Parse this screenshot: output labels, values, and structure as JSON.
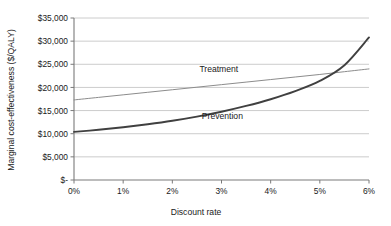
{
  "chart_data": {
    "type": "line",
    "title": "",
    "xlabel": "Discount rate",
    "ylabel": "Marginal cost-effectiveness ($/QALY)",
    "xlim": [
      0,
      6
    ],
    "ylim": [
      0,
      35000
    ],
    "grid": true,
    "grid_axis": "y",
    "legend": "inline-labels",
    "xticks": [
      0,
      1,
      2,
      3,
      4,
      5,
      6
    ],
    "xticklabels": [
      "0%",
      "1%",
      "2%",
      "3%",
      "4%",
      "5%",
      "6%"
    ],
    "yticks": [
      0,
      5000,
      10000,
      15000,
      20000,
      25000,
      30000,
      35000
    ],
    "yticklabels": [
      "$-",
      "$5,000",
      "$10,000",
      "$15,000",
      "$20,000",
      "$25,000",
      "$30,000",
      "$35,000"
    ],
    "x": [
      0,
      0.5,
      1,
      1.5,
      2,
      2.5,
      3,
      3.5,
      4,
      4.5,
      5,
      5.5,
      6
    ],
    "series": [
      {
        "name": "Treatment",
        "color": "#8c8c8c",
        "width": 1.0,
        "values": [
          17300,
          17850,
          18400,
          18950,
          19500,
          20050,
          20600,
          21150,
          21700,
          22250,
          22800,
          23400,
          24000
        ],
        "label_x": 2.55,
        "label_y": 23300
      },
      {
        "name": "Prevention",
        "color": "#404040",
        "width": 1.9,
        "values": [
          10400,
          10850,
          11400,
          12050,
          12800,
          13700,
          14750,
          16000,
          17450,
          19200,
          21400,
          24800,
          30800
        ],
        "label_x": 2.6,
        "label_y": 13100
      }
    ],
    "annotations": [
      {
        "name": "crossover",
        "x": 4.4,
        "y": 21800
      }
    ]
  },
  "axis": {
    "x_title": "Discount rate",
    "y_title": "Marginal cost-effectiveness ($/QALY)"
  },
  "colors": {
    "background": "#ffffff",
    "grid": "#bfbfbf",
    "axis": "#7a7a7a",
    "text": "#1a1a1a",
    "treatment": "#8c8c8c",
    "prevention": "#404040"
  }
}
